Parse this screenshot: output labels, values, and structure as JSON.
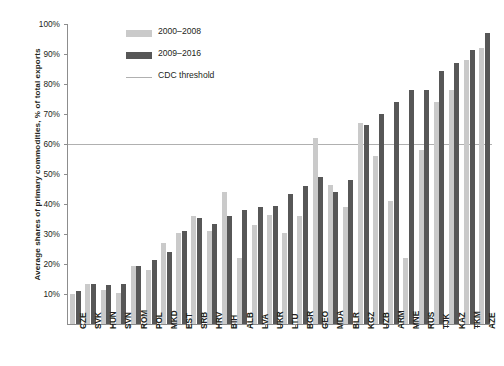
{
  "chart_data": {
    "type": "bar",
    "title": "",
    "xlabel": "",
    "ylabel": "Average shares of primary commodities, % of total exports",
    "ylim": [
      0,
      100
    ],
    "ytick_labels": [
      "100%",
      "90%",
      "80%",
      "70%",
      "60%",
      "50%",
      "40%",
      "30%",
      "20%",
      "10%"
    ],
    "ytick_values": [
      100,
      90,
      80,
      70,
      60,
      50,
      40,
      30,
      20,
      10
    ],
    "grid": false,
    "legend_position": "upper-left-inside",
    "categories": [
      "CZE",
      "SVK",
      "HUN",
      "SVN",
      "ROM",
      "POL",
      "MKD",
      "EST",
      "SRB",
      "HRV",
      "BIH",
      "ALB",
      "LVA",
      "UKR",
      "LTU",
      "BGR",
      "GEO",
      "MDA",
      "BLR",
      "KGZ",
      "UZB",
      "ARM",
      "MNE",
      "RUS",
      "TJK",
      "KAZ",
      "TKM",
      "AZE"
    ],
    "series": [
      {
        "name": "2000–2008",
        "color": "#cacaca",
        "values": [
          10,
          13.5,
          11.5,
          10.5,
          19.5,
          18,
          27,
          30.5,
          36,
          31,
          44,
          22,
          33,
          36.5,
          30.5,
          36,
          62,
          46.5,
          39,
          67,
          56,
          41,
          22,
          58,
          74,
          78,
          88,
          92
        ]
      },
      {
        "name": "2009–2016",
        "color": "#575757",
        "values": [
          11,
          13.5,
          13,
          13.5,
          19.5,
          21.5,
          24,
          31,
          35.5,
          33.5,
          36,
          38,
          39,
          39.5,
          43.5,
          46,
          49,
          44,
          48,
          66.5,
          70,
          74,
          78,
          78,
          84.5,
          87,
          91.5,
          97
        ]
      }
    ],
    "annotations": [
      {
        "name": "CDC threshold",
        "type": "hline",
        "value": 60,
        "color": "#b0b0b0"
      }
    ]
  },
  "legend": {
    "items": [
      {
        "label": "2000–2008",
        "marker": "light-swatch"
      },
      {
        "label": "2009–2016",
        "marker": "dark-swatch"
      },
      {
        "label": "CDC threshold",
        "marker": "line"
      }
    ]
  }
}
